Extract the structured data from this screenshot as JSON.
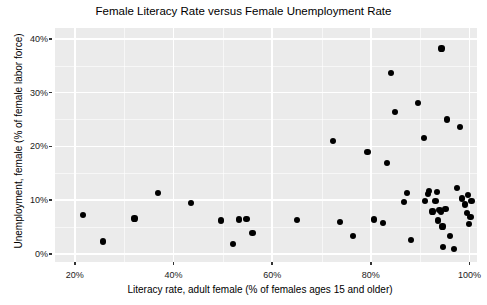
{
  "chart_data": {
    "type": "scatter",
    "title": "Female Literacy Rate versus Female Unemployment Rate",
    "xlabel": "Literacy rate, adult female (% of females ages 15 and older)",
    "ylabel": "Unemployment, female (% of female labor force)",
    "xlim": [
      16,
      101.5
    ],
    "ylim": [
      -1.5,
      42
    ],
    "xticks": [
      20,
      40,
      60,
      80,
      100
    ],
    "xtick_labels": [
      "20%",
      "40%",
      "60%",
      "80%",
      "100%"
    ],
    "yticks": [
      0,
      10,
      20,
      30,
      40
    ],
    "ytick_labels": [
      "0%",
      "10%",
      "20%",
      "30%",
      "40%"
    ],
    "x_minor_ticks": [
      30,
      50,
      70,
      90
    ],
    "y_minor_ticks": [
      5,
      15,
      25,
      35
    ],
    "grid": true,
    "legend": "none",
    "panel_background": "#ebebeb",
    "grid_color": "#ffffff",
    "point_color": "#000000",
    "point_size": 6,
    "series": [
      {
        "name": "Countries",
        "points": [
          [
            21.6,
            7.2
          ],
          [
            25.7,
            2.3
          ],
          [
            32.1,
            6.6
          ],
          [
            36.8,
            11.3
          ],
          [
            43.6,
            9.4
          ],
          [
            49.6,
            6.2
          ],
          [
            52.1,
            1.9
          ],
          [
            53.3,
            6.4
          ],
          [
            54.8,
            6.5
          ],
          [
            56.0,
            3.9
          ],
          [
            65.1,
            6.3
          ],
          [
            72.4,
            21.0
          ],
          [
            73.7,
            6.0
          ],
          [
            76.4,
            3.3
          ],
          [
            79.3,
            19.0
          ],
          [
            80.6,
            6.4
          ],
          [
            82.4,
            5.8
          ],
          [
            83.3,
            16.9
          ],
          [
            84.0,
            33.6
          ],
          [
            84.9,
            26.4
          ],
          [
            86.7,
            9.6
          ],
          [
            87.3,
            11.3
          ],
          [
            88.1,
            2.6
          ],
          [
            89.6,
            28.0
          ],
          [
            90.7,
            21.6
          ],
          [
            90.9,
            9.8
          ],
          [
            91.6,
            11.1
          ],
          [
            91.8,
            11.7
          ],
          [
            92.5,
            7.9
          ],
          [
            93.1,
            9.9
          ],
          [
            93.4,
            11.5
          ],
          [
            93.6,
            6.2
          ],
          [
            93.9,
            8.1
          ],
          [
            94.2,
            7.8
          ],
          [
            94.3,
            38.2
          ],
          [
            94.5,
            5.1
          ],
          [
            94.6,
            1.3
          ],
          [
            95.1,
            8.3
          ],
          [
            95.4,
            25.0
          ],
          [
            96.1,
            3.4
          ],
          [
            96.8,
            0.9
          ],
          [
            97.4,
            12.3
          ],
          [
            98.1,
            23.6
          ],
          [
            98.4,
            10.3
          ],
          [
            99.1,
            9.2
          ],
          [
            99.4,
            7.6
          ],
          [
            99.6,
            11.0
          ],
          [
            99.8,
            5.6
          ],
          [
            100.2,
            6.9
          ],
          [
            100.4,
            9.8
          ]
        ]
      }
    ]
  }
}
